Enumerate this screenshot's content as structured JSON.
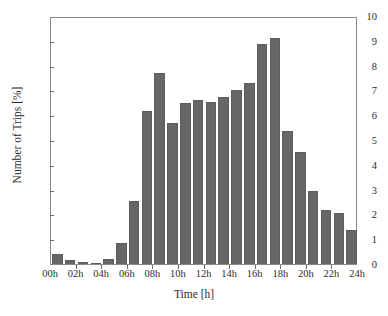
{
  "chart_data": {
    "type": "bar",
    "title": "",
    "xlabel": "Time [h]",
    "ylabel": "Number of Trips [%]",
    "xlim": [
      0,
      24
    ],
    "ylim": [
      0,
      10
    ],
    "grid": false,
    "legend": null,
    "bar_color": "#666666",
    "frame_color": "#8a8a8a",
    "categories": [
      "00h",
      "01h",
      "02h",
      "03h",
      "04h",
      "05h",
      "06h",
      "07h",
      "08h",
      "09h",
      "10h",
      "11h",
      "12h",
      "13h",
      "14h",
      "15h",
      "16h",
      "17h",
      "18h",
      "19h",
      "20h",
      "21h",
      "22h",
      "23h"
    ],
    "values": [
      0.4,
      0.18,
      0.1,
      0.05,
      0.2,
      0.85,
      2.55,
      6.15,
      7.7,
      5.68,
      6.5,
      6.62,
      6.52,
      6.75,
      7.03,
      7.28,
      8.88,
      9.13,
      5.37,
      4.53,
      2.94,
      2.18,
      2.05,
      1.38
    ],
    "x_tick_labels": [
      "00h",
      "02h",
      "04h",
      "06h",
      "08h",
      "10h",
      "12h",
      "14h",
      "16h",
      "18h",
      "20h",
      "22h",
      "24h"
    ],
    "x_tick_values": [
      0,
      2,
      4,
      6,
      8,
      10,
      12,
      14,
      16,
      18,
      20,
      22,
      24
    ],
    "y_tick_labels": [
      "0",
      "1",
      "2",
      "3",
      "4",
      "5",
      "6",
      "7",
      "8",
      "9",
      "10"
    ],
    "y_tick_values": [
      0,
      1,
      2,
      3,
      4,
      5,
      6,
      7,
      8,
      9,
      10
    ]
  }
}
